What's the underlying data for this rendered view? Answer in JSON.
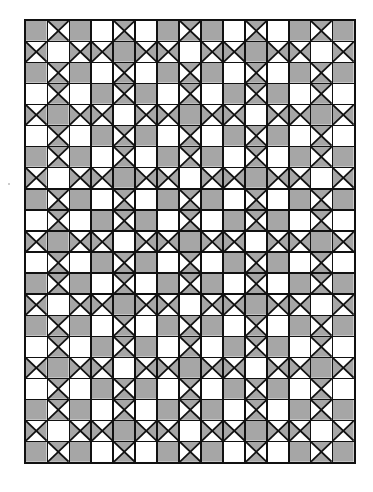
{
  "diagram": {
    "title": "",
    "type": "quilt-block-grid",
    "columns": 15,
    "rows_count": 21,
    "legend": {
      "G": "solid gray square",
      "W": "plain white square",
      "V": "hourglass square, gray top and bottom triangles",
      "H": "hourglass square, gray left and right triangles"
    },
    "colors": {
      "gray_fill": "#a9a9a9",
      "gray_dot": "#7a7a7a",
      "white_fill": "#ffffff",
      "line": "#111111"
    },
    "rows": [
      "GVGWVWGVGWVWGVG",
      "HWHHGHHWHHGHHWH",
      "GVGWVWGVGWVWGVG",
      "WVWGVGWVWGVGWVW",
      "HGHHWHHGHHWHHGH",
      "WVWGVGWVWGVGWVW",
      "GVGWVWGVGWVWGVG",
      "HWHHGHHWHHGHHWH",
      "GVGWVWGVGWVWGVG",
      "WVWGVGWVWGVGWVW",
      "HGHHWHHGHHWHHGH",
      "WVWGVGWVWGVGWVW",
      "GVGWVWGVGWVWGVG",
      "HWHHGHHWHHGHHWH",
      "GVGWVWGVGWVWGVG",
      "WVWGVGWVWGVGWVW",
      "HGHHWHHGHHWHHGH",
      "WVWGVGWVWGVGWVW",
      "GVGWVWGVGWVWGVG",
      "HWHHGHHWHHGHHWH",
      "GVGWVWGVGWVWGVG"
    ]
  }
}
